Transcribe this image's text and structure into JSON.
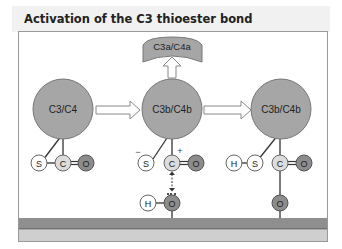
{
  "title": "Activation of the C3 thioester bond",
  "colors": {
    "protein": "#a6a6a6",
    "atom_light": "#ffffff",
    "atom_mid": "#dcdcdc",
    "atom_dark": "#8c8c8c",
    "membrane_top": "#8f8f8f",
    "membrane_bottom": "#cfcfcf"
  },
  "stage1": {
    "protein_label": "C3/C4",
    "atoms": {
      "s": "S",
      "c": "C",
      "o": "O"
    }
  },
  "stage2": {
    "protein_label": "C3b/C4b",
    "released_fragment": "C3a/C4a",
    "charge_minus": "−",
    "charge_plus": "+",
    "atoms": {
      "s": "S",
      "c": "C",
      "o": "O",
      "h": "H",
      "surface_o": "O"
    }
  },
  "stage3": {
    "protein_label": "C3b/C4b",
    "atoms": {
      "h": "H",
      "s": "S",
      "c": "C",
      "o": "O",
      "surface_o": "O"
    }
  }
}
